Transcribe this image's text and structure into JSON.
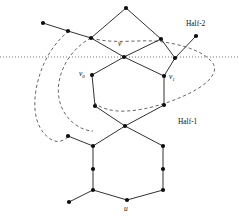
{
  "figure": {
    "width": 239,
    "height": 216,
    "background": "#ffffff",
    "type": "graph-diagram"
  },
  "styles": {
    "edge_color": "#1a1a1a",
    "node_color": "#0d0d0d",
    "node_radius": 2.1,
    "cut_line_color": "#555555",
    "region_boundary_color": "#4a4a4a",
    "label_color": "#111111"
  },
  "labels": {
    "v": {
      "text": "v",
      "sub": "",
      "x": 118,
      "y": 44
    },
    "v0": {
      "text": "v",
      "sub": "0",
      "x": 82,
      "y": 74
    },
    "v1": {
      "text": "v",
      "sub": "1",
      "x": 160,
      "y": 77
    },
    "u": {
      "text": "u",
      "sub": "",
      "x": 124,
      "y": 209
    }
  },
  "regions": [
    {
      "name": "half-2",
      "text": "Half-2",
      "x": 186,
      "y": 24
    },
    {
      "name": "half-1",
      "text": "Half-1",
      "x": 178,
      "y": 122
    }
  ],
  "cut_line": {
    "name": "horizontal-cut-line",
    "y": 57,
    "x_start": 0,
    "x_end": 239
  },
  "nodes": [
    {
      "id": "n-top",
      "x": 126,
      "y": 8
    },
    {
      "id": "n-tl-far",
      "x": 43,
      "y": 23
    },
    {
      "id": "n-tl-mid",
      "x": 68,
      "y": 31
    },
    {
      "id": "n-tl-near",
      "x": 91,
      "y": 38
    },
    {
      "id": "n-tr",
      "x": 161,
      "y": 39
    },
    {
      "id": "n-v",
      "x": 124,
      "y": 57
    },
    {
      "id": "n-ur-far",
      "x": 196,
      "y": 36
    },
    {
      "id": "n-ur-mid",
      "x": 175,
      "y": 58
    },
    {
      "id": "n-v0",
      "x": 92,
      "y": 75
    },
    {
      "id": "n-v1",
      "x": 164,
      "y": 76
    },
    {
      "id": "n-lh-left",
      "x": 95,
      "y": 106
    },
    {
      "id": "n-lh-right",
      "x": 164,
      "y": 105
    },
    {
      "id": "n-mid",
      "x": 125,
      "y": 126
    },
    {
      "id": "n-ml-far",
      "x": 68,
      "y": 136
    },
    {
      "id": "n-ml",
      "x": 93,
      "y": 146
    },
    {
      "id": "n-mr",
      "x": 163,
      "y": 146
    },
    {
      "id": "n-bl-mid",
      "x": 93,
      "y": 169
    },
    {
      "id": "n-br-mid",
      "x": 163,
      "y": 169
    },
    {
      "id": "n-bl",
      "x": 93,
      "y": 190
    },
    {
      "id": "n-br",
      "x": 163,
      "y": 190
    },
    {
      "id": "n-bl-far",
      "x": 69,
      "y": 202
    },
    {
      "id": "n-u",
      "x": 127,
      "y": 200
    }
  ],
  "edges": [
    {
      "from": "n-top",
      "to": "n-tl-near"
    },
    {
      "from": "n-top",
      "to": "n-tr"
    },
    {
      "from": "n-tl-near",
      "to": "n-tl-mid"
    },
    {
      "from": "n-tl-mid",
      "to": "n-tl-far"
    },
    {
      "from": "n-tl-near",
      "to": "n-v"
    },
    {
      "from": "n-tr",
      "to": "n-v"
    },
    {
      "from": "n-tr",
      "to": "n-ur-mid"
    },
    {
      "from": "n-ur-mid",
      "to": "n-ur-far"
    },
    {
      "from": "n-ur-mid",
      "to": "n-v1"
    },
    {
      "from": "n-v",
      "to": "n-v0"
    },
    {
      "from": "n-v",
      "to": "n-v1"
    },
    {
      "from": "n-v0",
      "to": "n-lh-left"
    },
    {
      "from": "n-v1",
      "to": "n-lh-right"
    },
    {
      "from": "n-lh-left",
      "to": "n-mid"
    },
    {
      "from": "n-lh-right",
      "to": "n-mid"
    },
    {
      "from": "n-mid",
      "to": "n-ml"
    },
    {
      "from": "n-mid",
      "to": "n-mr"
    },
    {
      "from": "n-ml",
      "to": "n-ml-far"
    },
    {
      "from": "n-ml",
      "to": "n-bl-mid"
    },
    {
      "from": "n-bl-mid",
      "to": "n-bl"
    },
    {
      "from": "n-mr",
      "to": "n-br-mid"
    },
    {
      "from": "n-br-mid",
      "to": "n-br"
    },
    {
      "from": "n-bl",
      "to": "n-bl-far"
    },
    {
      "from": "n-bl",
      "to": "n-u"
    },
    {
      "from": "n-u",
      "to": "n-br"
    }
  ],
  "region_paths": {
    "half2_loop": "M 91 38 C 120 46 150 41 172 44 C 196 47 216 56 213 70 C 210 84 186 94 164 103 C 146 111 130 113 120 110",
    "half1_loop": "M 68 31 C 47 46 34 74 35 100 C 36 126 52 142 68 136 C 72 134 75 131 76 128"
  }
}
